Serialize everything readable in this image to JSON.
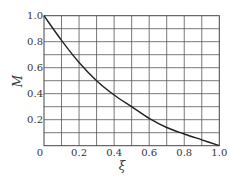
{
  "chart_data": {
    "type": "line",
    "title": "",
    "xlabel": "ξ",
    "ylabel": "M",
    "xlim": [
      0,
      1.0
    ],
    "ylim": [
      0,
      1.0
    ],
    "grid": true,
    "x_grid_step": 0.1,
    "y_grid_step": 0.1,
    "x_ticks": [
      "0",
      "0.2",
      "0.4",
      "0.6",
      "0.8",
      "1.0"
    ],
    "y_ticks": [
      "0.2",
      "0.4",
      "0.6",
      "0.8",
      "1.0"
    ],
    "series": [
      {
        "name": "M",
        "x": [
          0,
          0.1,
          0.2,
          0.3,
          0.4,
          0.5,
          0.6,
          0.7,
          0.8,
          0.9,
          1.0
        ],
        "values": [
          1.0,
          0.81,
          0.64,
          0.5,
          0.39,
          0.3,
          0.21,
          0.14,
          0.09,
          0.045,
          0.0
        ]
      }
    ],
    "colors": {
      "line": "#222222",
      "grid": "#555555",
      "text": "#333333"
    }
  }
}
